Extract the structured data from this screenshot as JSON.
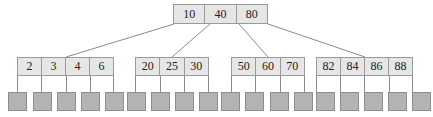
{
  "diagram": {
    "type": "b-tree",
    "root": {
      "keys": [
        "10",
        "40",
        "80"
      ]
    },
    "leaves": [
      {
        "keys": [
          "2",
          "3",
          "4",
          "6"
        ]
      },
      {
        "keys": [
          "20",
          "25",
          "30"
        ]
      },
      {
        "keys": [
          "50",
          "60",
          "70"
        ]
      },
      {
        "keys": [
          "82",
          "84",
          "86",
          "88"
        ]
      }
    ],
    "data_pages_count": 18,
    "colors": {
      "key_fill": "#e6e6e6",
      "border": "#9a9a9a",
      "page_fill": "#b3b3b3",
      "edge": "#8a8a8a"
    }
  }
}
